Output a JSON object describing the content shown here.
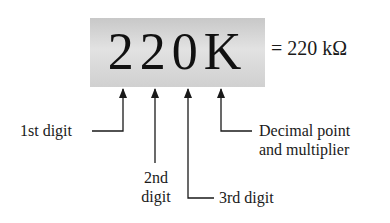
{
  "diagram": {
    "code": "220K",
    "equivalent": "= 220 kΩ",
    "labels": {
      "first_digit": "1st digit",
      "second_digit_line1": "2nd",
      "second_digit_line2": "digit",
      "third_digit": "3rd digit",
      "multiplier_line1": "Decimal point",
      "multiplier_line2": "and multiplier"
    },
    "colors": {
      "box_fill": "#d6d6d6",
      "line": "#1a1a1a",
      "text": "#111111"
    }
  }
}
